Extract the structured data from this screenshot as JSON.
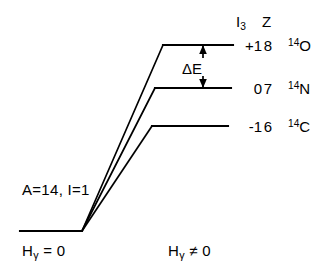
{
  "figure": {
    "type": "energy-level-diagram",
    "background_color": "#ffffff",
    "stroke_color": "#000000"
  },
  "columns": {
    "header_i3_main": "I",
    "header_i3_sub": "3",
    "header_z": "Z"
  },
  "levels": [
    {
      "name": "oxygen-14",
      "i3": "+1",
      "z": "8",
      "mass_number": "14",
      "element": "O",
      "y": 45,
      "line_x1": 163,
      "line_x2": 233
    },
    {
      "name": "nitrogen-14",
      "i3": "0",
      "z": "7",
      "mass_number": "14",
      "element": "N",
      "y": 88,
      "line_x1": 155,
      "line_x2": 231
    },
    {
      "name": "carbon-14",
      "i3": "-1",
      "z": "6",
      "mass_number": "14",
      "element": "C",
      "y": 126,
      "line_x1": 152,
      "line_x2": 228
    }
  ],
  "annotations": {
    "delta_e": "ΔE",
    "quantum_numbers": "A=14, I=1",
    "field_off_h": "H",
    "field_off_gamma": "γ",
    "field_off_rel": "= 0",
    "field_on_h": "H",
    "field_on_gamma": "γ",
    "field_on_rel": "≠ 0"
  },
  "ground_state": {
    "line_x1": 20,
    "line_x2": 82,
    "y": 231
  },
  "fan_origin": {
    "x": 82,
    "y": 231
  },
  "delta_e_arrow": {
    "x": 203,
    "y_top": 45,
    "y_bottom": 88
  }
}
